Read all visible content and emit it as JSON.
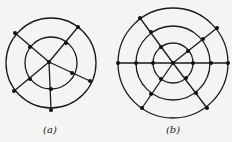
{
  "colors": {
    "background": "#f4f4f2",
    "stroke": "#1a1a1a",
    "node": "#111111"
  },
  "figures": [
    {
      "id": "a",
      "label": "(a)",
      "label_pos": [
        50,
        134
      ],
      "circles": [
        {
          "cx": 51,
          "cy": 63,
          "r": 45
        },
        {
          "cx": 51,
          "cy": 63,
          "r": 26
        }
      ],
      "edges": [
        [
          49,
          62,
          15,
          33
        ],
        [
          49,
          62,
          78,
          27
        ],
        [
          49,
          62,
          14,
          91
        ],
        [
          49,
          62,
          90,
          81
        ],
        [
          49,
          62,
          51,
          110
        ]
      ],
      "nodes": [
        [
          49,
          62
        ],
        [
          15,
          33
        ],
        [
          30,
          47
        ],
        [
          78,
          27
        ],
        [
          66,
          43
        ],
        [
          14,
          91
        ],
        [
          30,
          79
        ],
        [
          90,
          81
        ],
        [
          72,
          73
        ],
        [
          51,
          110
        ],
        [
          51,
          89
        ]
      ]
    },
    {
      "id": "b",
      "label": "(b)",
      "label_pos": [
        173,
        134
      ],
      "circles": [
        {
          "cx": 173,
          "cy": 63,
          "r": 55
        },
        {
          "cx": 173,
          "cy": 63,
          "r": 37
        },
        {
          "cx": 173,
          "cy": 63,
          "r": 20
        }
      ],
      "edges": [
        [
          118,
          63,
          228,
          63
        ],
        [
          173,
          63,
          140,
          18
        ],
        [
          173,
          63,
          217,
          28
        ],
        [
          173,
          63,
          142,
          108
        ],
        [
          173,
          63,
          207,
          108
        ]
      ],
      "nodes": [
        [
          173,
          63
        ],
        [
          118,
          63
        ],
        [
          136,
          63
        ],
        [
          153,
          63
        ],
        [
          193,
          63
        ],
        [
          211,
          63
        ],
        [
          228,
          63
        ],
        [
          140,
          18
        ],
        [
          151,
          32
        ],
        [
          161,
          47
        ],
        [
          217,
          28
        ],
        [
          203,
          39
        ],
        [
          188,
          51
        ],
        [
          142,
          108
        ],
        [
          151,
          94
        ],
        [
          161,
          79
        ],
        [
          207,
          108
        ],
        [
          196,
          93
        ],
        [
          186,
          78
        ]
      ]
    }
  ]
}
